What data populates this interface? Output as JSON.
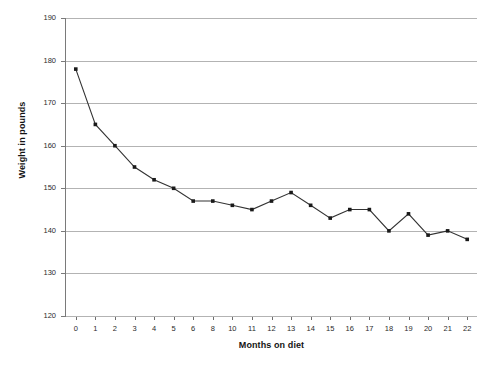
{
  "chart_data": {
    "type": "line",
    "title": "",
    "xlabel": "Months on diet",
    "ylabel": "Weight in pounds",
    "categories": [
      "0",
      "1",
      "2",
      "3",
      "4",
      "5",
      "6",
      "8",
      "10",
      "11",
      "12",
      "13",
      "14",
      "15",
      "16",
      "17",
      "18",
      "19",
      "20",
      "21",
      "22"
    ],
    "values": [
      178,
      165,
      160,
      155,
      152,
      150,
      147,
      147,
      146,
      145,
      147,
      149,
      146,
      143,
      145,
      145,
      140,
      144,
      139,
      140,
      138
    ],
    "series": [
      {
        "name": "Weight",
        "values": [
          178,
          165,
          160,
          155,
          152,
          150,
          147,
          147,
          146,
          145,
          147,
          149,
          146,
          143,
          145,
          145,
          140,
          144,
          139,
          140,
          138
        ]
      }
    ],
    "ylim": [
      120,
      190
    ],
    "yticks": [
      120,
      130,
      140,
      150,
      160,
      170,
      180,
      190
    ],
    "ytick_labels": [
      "120",
      "130",
      "140",
      "150",
      "160",
      "170",
      "180",
      "190"
    ],
    "grid": "horizontal",
    "legend": "none",
    "marker": "square",
    "line_color": "#333333",
    "marker_color": "#1a1a1a",
    "grid_color": "#b3b3b3",
    "background": "#ffffff"
  }
}
